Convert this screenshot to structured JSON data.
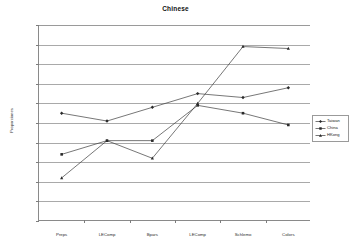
{
  "chart_data": {
    "type": "line",
    "title": "Chinese",
    "xlabel": "",
    "ylabel": "Proporciones",
    "ylim": [
      0,
      1
    ],
    "yticks": [
      0,
      0.1,
      0.2,
      0.3,
      0.4,
      0.5,
      0.6,
      0.7,
      0.8,
      0.9,
      1
    ],
    "ytick_labels": [
      "0",
      "0.1",
      "0.2",
      "0.3",
      "0.4",
      "0.5",
      "0.6",
      "0.7",
      "0.8",
      "0.9",
      "1"
    ],
    "grid": true,
    "legend_position": "right",
    "categories": [
      "Preps",
      "LEComp",
      "Bpars",
      "LEComp",
      "Schlemo",
      "Colors"
    ],
    "series": [
      {
        "name": "Taiwan",
        "marker": "diamond",
        "values": [
          0.55,
          0.51,
          0.58,
          0.65,
          0.63,
          0.68
        ]
      },
      {
        "name": "China",
        "marker": "square",
        "values": [
          0.34,
          0.41,
          0.41,
          0.59,
          0.55,
          0.49
        ]
      },
      {
        "name": "HKong",
        "marker": "triangle",
        "values": [
          0.22,
          0.41,
          0.32,
          0.6,
          0.89,
          0.88
        ]
      }
    ]
  },
  "legend": {
    "entries": [
      {
        "label": "Taiwan"
      },
      {
        "label": "China"
      },
      {
        "label": "HKong"
      }
    ]
  }
}
